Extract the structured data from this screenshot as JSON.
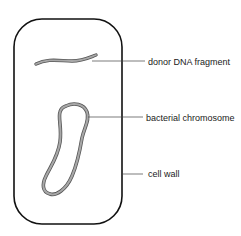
{
  "diagram": {
    "type": "labeled biology diagram",
    "labels": {
      "donor_dna": "donor DNA fragment",
      "chromosome": "bacterial chromosome",
      "cell_wall": "cell wall"
    },
    "colors": {
      "outline": "#111111",
      "dna_fill": "#9a9a9a",
      "dna_edge": "#555555",
      "leader_line": "#444444",
      "background": "#ffffff"
    }
  }
}
